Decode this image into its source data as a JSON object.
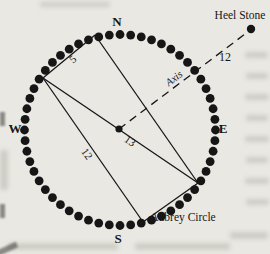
{
  "colors": {
    "paper": "#eae8e3",
    "ink": "#161616"
  },
  "diagram": {
    "cardinal": {
      "north": "N",
      "east": "E",
      "south": "S",
      "west": "W"
    },
    "heel_stone_label": "Heel Stone",
    "aubrey_circle_label": "Aubrey Circle",
    "axis_label": "Axis",
    "measurements": {
      "short_side": "5",
      "long_side": "12",
      "diagonal": "13",
      "heel_distance": "12"
    },
    "geometry": {
      "ring": {
        "cx": 120,
        "cy": 130,
        "r": 95.5,
        "hole_count": 56,
        "hole_r": 4.4
      },
      "center_dot": {
        "x": 119,
        "y": 129,
        "r": 3.6
      },
      "heel_dot": {
        "x": 251,
        "y": 29,
        "r": 4.2
      },
      "corners": {
        "A": [
          95,
          35
        ],
        "B": [
          43,
          78
        ],
        "C": [
          198,
          183
        ],
        "D": [
          143,
          222
        ]
      },
      "edges": [
        [
          "A",
          "B"
        ],
        [
          "B",
          "D"
        ],
        [
          "D",
          "C"
        ],
        [
          "C",
          "A"
        ],
        [
          "B",
          "C"
        ]
      ],
      "axis_line": {
        "x1": 119,
        "y1": 129,
        "x2": 249,
        "y2": 31
      }
    }
  }
}
